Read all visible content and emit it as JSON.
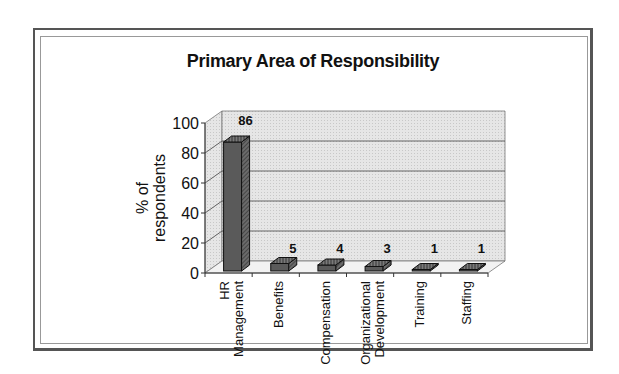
{
  "chart_data": {
    "type": "bar",
    "style": "3d-column",
    "title": "Primary Area of Responsibility",
    "xlabel": "",
    "ylabel": [
      "% of",
      "respondents"
    ],
    "ylim": [
      0,
      100
    ],
    "yticks": [
      0,
      20,
      40,
      60,
      80,
      100
    ],
    "grid": true,
    "legend": "none",
    "categories": [
      [
        "HR",
        "Management"
      ],
      [
        "Benefits"
      ],
      [
        "Compensation"
      ],
      [
        "Organizational",
        "Development"
      ],
      [
        "Training"
      ],
      [
        "Staffing"
      ]
    ],
    "values": [
      86,
      5,
      4,
      3,
      1,
      1
    ],
    "data_labels": [
      "86",
      "5",
      "4",
      "3",
      "1",
      "1"
    ],
    "colors": {
      "bar_front": "#5a5a5a",
      "bar_side": "#3a3a3a",
      "bar_top": "#8a8a8a",
      "wall": "#e4e4e4",
      "floor": "#f0f0f0",
      "grid": "#555555"
    }
  }
}
